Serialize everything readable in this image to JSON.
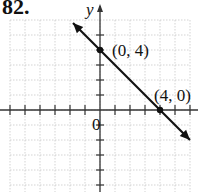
{
  "problem": {
    "number": "82."
  },
  "chart_data": {
    "type": "line",
    "title": "",
    "xlabel": "",
    "ylabel": "y",
    "origin_label": "0",
    "grid": true,
    "xlim": [
      -6,
      6
    ],
    "ylim": [
      -5,
      6
    ],
    "line": {
      "slope": -1,
      "intercept": 4,
      "equation": "y = -x + 4",
      "arrows": "both"
    },
    "points": [
      {
        "x": 0,
        "y": 4,
        "label": "(0, 4)"
      },
      {
        "x": 4,
        "y": 0,
        "label": "(4, 0)"
      }
    ]
  },
  "labels": {
    "y_axis": "y",
    "origin": "0",
    "point1": "(0, 4)",
    "point2": "(4, 0)"
  },
  "colors": {
    "grid": "#c8c8c8",
    "axis": "#333333",
    "line": "#111111"
  }
}
